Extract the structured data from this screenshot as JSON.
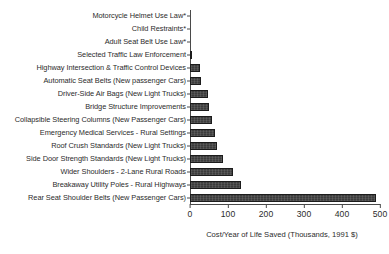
{
  "chart_data": {
    "type": "bar",
    "orientation": "horizontal",
    "title": "",
    "xlabel": "Cost/Year of Life Saved (Thousands, 1991 $)",
    "ylabel": "",
    "xlim": [
      0,
      500
    ],
    "xticks": [
      0,
      100,
      200,
      300,
      400,
      500
    ],
    "xtick_labels": [
      "0",
      "100",
      "200",
      "300",
      "400",
      "500"
    ],
    "grid": false,
    "legend": false,
    "bar_color": "#3c3c3c",
    "bar_edge_color": "#1c1c1c",
    "axis_color": "#4a4a4a",
    "note": "* denotes measures with zero or negative net cost per year of life saved",
    "categories": [
      "Motorcycle Helmet Use Law*",
      "Child Restraints*",
      "Adult Seat Belt Use Law*",
      "Selected Traffic Law Enforcement",
      "Highway Intersection & Traffic Control Devices",
      "Automatic Seat Belts (New passenger Cars)",
      "Driver-Side Air Bags (New Light Trucks)",
      "Bridge Structure Improvements",
      "Collapsible Steering Columns (New Passenger Cars)",
      "Emergency Medical Services - Rural Settings",
      "Roof Crush Standards (New Light Trucks)",
      "Side Door Strength Standards (New Light Trucks)",
      "Wider Shoulders - 2-Lane Rural Roads",
      "Breakaway Utility Poles - Rural Highways",
      "Rear Seat Shoulder Belts (New Passenger Cars)"
    ],
    "values": [
      0,
      0,
      0,
      3,
      26,
      28,
      48,
      50,
      58,
      66,
      70,
      88,
      113,
      135,
      490
    ]
  }
}
